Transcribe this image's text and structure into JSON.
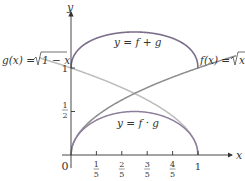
{
  "diagram": {
    "axes": {
      "x_label": "x",
      "y_label": "y",
      "origin_label": "0"
    },
    "x_ticks": [
      {
        "num": "1",
        "den": "5"
      },
      {
        "num": "2",
        "den": "5"
      },
      {
        "num": "3",
        "den": "5"
      },
      {
        "num": "4",
        "den": "5"
      }
    ],
    "x_end_label": "1",
    "y_ticks": {
      "one": "1",
      "half_num": "1",
      "half_den": "2"
    },
    "labels": {
      "g": "g(x) = √1 − x",
      "g_prefix": "g(x) = ",
      "g_radicand": "1 − x",
      "f": "f(x) = √x",
      "f_prefix": "f(x) = ",
      "f_radicand": "x",
      "sum": "y = f + g",
      "product": "y = f · g"
    },
    "colors": {
      "axis": "#333333",
      "sum_curve": "#7a6a8c",
      "product_curve": "#8a7a9a",
      "f_curve": "#888888",
      "g_curve": "#b8b8b8"
    }
  },
  "chart_data": {
    "type": "line",
    "title": "",
    "xlabel": "x",
    "ylabel": "y",
    "xlim": [
      0,
      1
    ],
    "ylim": [
      0,
      1.414
    ],
    "x_ticks": [
      "0",
      "1/5",
      "2/5",
      "3/5",
      "4/5",
      "1"
    ],
    "y_ticks": [
      "1/2",
      "1"
    ],
    "series": [
      {
        "name": "f(x) = √x",
        "x": [
          0,
          0.2,
          0.4,
          0.6,
          0.8,
          1
        ],
        "values": [
          0,
          0.447,
          0.632,
          0.775,
          0.894,
          1
        ]
      },
      {
        "name": "g(x) = √(1−x)",
        "x": [
          0,
          0.2,
          0.4,
          0.6,
          0.8,
          1
        ],
        "values": [
          1,
          0.894,
          0.775,
          0.632,
          0.447,
          0
        ]
      },
      {
        "name": "y = f + g",
        "x": [
          0,
          0.2,
          0.4,
          0.5,
          0.6,
          0.8,
          1
        ],
        "values": [
          1,
          1.342,
          1.407,
          1.414,
          1.407,
          1.342,
          1
        ]
      },
      {
        "name": "y = f · g",
        "x": [
          0,
          0.2,
          0.4,
          0.5,
          0.6,
          0.8,
          1
        ],
        "values": [
          0,
          0.4,
          0.49,
          0.5,
          0.49,
          0.4,
          0
        ]
      }
    ]
  }
}
